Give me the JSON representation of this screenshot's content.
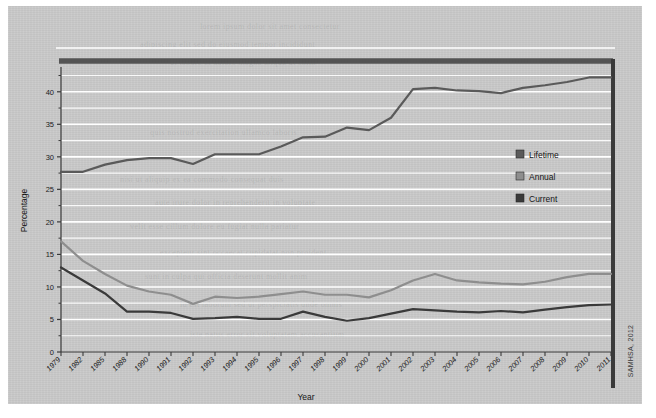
{
  "source_note": "SAMHSA, 2012",
  "axes": {
    "ylabel": "Percentage",
    "xlabel": "Year",
    "yticks": [
      "0",
      "5",
      "10",
      "15",
      "20",
      "25",
      "30",
      "35",
      "40"
    ],
    "ymin": 0,
    "ymax": 43.5
  },
  "legend": {
    "position": "right-middle",
    "entries": [
      {
        "label": "Lifetime",
        "color": "#5a5a5a"
      },
      {
        "label": "Annual",
        "color": "#8e8e8e"
      },
      {
        "label": "Current",
        "color": "#3a3a3a"
      }
    ]
  },
  "colors": {
    "paper": "#c9c9c9",
    "gridline": "#ffffff",
    "axis": "#3a3a3a",
    "frame_top": "#545454",
    "frame_right": "#3a3a3a",
    "lifetime": "#5a5a5a",
    "annual": "#8e8e8e",
    "current": "#3a3a3a"
  },
  "chart_data": {
    "type": "line",
    "title": "",
    "xlabel": "Year",
    "ylabel": "Percentage",
    "ylim": [
      0,
      43.5
    ],
    "grid": true,
    "legend_position": "right",
    "categories": [
      "1979",
      "1982",
      "1985",
      "1988",
      "1990",
      "1991",
      "1992",
      "1993",
      "1994",
      "1995",
      "1996",
      "1997",
      "1998",
      "1999",
      "2000",
      "2001",
      "2002",
      "2003",
      "2004",
      "2005",
      "2006",
      "2007",
      "2008",
      "2009",
      "2010",
      "2011"
    ],
    "series": [
      {
        "name": "Lifetime",
        "color": "#5a5a5a",
        "values": [
          27.7,
          27.7,
          28.8,
          29.5,
          29.8,
          29.8,
          28.9,
          30.4,
          30.4,
          30.4,
          31.6,
          33.0,
          33.1,
          34.5,
          34.1,
          36.0,
          40.4,
          40.6,
          40.2,
          40.1,
          39.8,
          40.6,
          41.0,
          41.5,
          42.2,
          42.2
        ]
      },
      {
        "name": "Annual",
        "color": "#8e8e8e",
        "values": [
          17.0,
          14.0,
          12.0,
          10.2,
          9.3,
          8.8,
          7.4,
          8.5,
          8.3,
          8.5,
          8.9,
          9.3,
          8.8,
          8.8,
          8.4,
          9.5,
          11.0,
          12.0,
          11.0,
          10.7,
          10.5,
          10.4,
          10.8,
          11.5,
          12.0,
          12.0
        ]
      },
      {
        "name": "Current",
        "color": "#3a3a3a",
        "values": [
          13.0,
          11.0,
          9.0,
          6.2,
          6.2,
          6.0,
          5.1,
          5.2,
          5.4,
          5.1,
          5.1,
          6.2,
          5.4,
          4.8,
          5.2,
          5.9,
          6.6,
          6.4,
          6.2,
          6.1,
          6.3,
          6.1,
          6.5,
          6.9,
          7.2,
          7.3
        ]
      }
    ]
  }
}
